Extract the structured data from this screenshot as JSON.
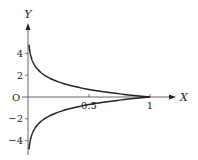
{
  "chart_data": {
    "type": "line",
    "title": "",
    "xlabel": "X",
    "ylabel": "Y",
    "origin_label": "O",
    "x_ticks": [
      0.5,
      1
    ],
    "x_tick_labels": [
      "0.5",
      "1"
    ],
    "y_ticks": [
      4,
      2,
      -2,
      -4
    ],
    "y_tick_labels": [
      "4",
      "2",
      "−2",
      "−4"
    ],
    "xlim": [
      0,
      1.4
    ],
    "ylim": [
      -4.8,
      4.8
    ],
    "grid": false,
    "legend": "none",
    "series": [
      {
        "name": "y = -ln x (upper branch)",
        "x": [
          0.0083,
          0.02,
          0.05,
          0.1,
          0.2,
          0.3,
          0.4,
          0.5,
          0.6,
          0.7,
          0.8,
          0.9,
          1.0
        ],
        "values": [
          4.8,
          3.91,
          3.0,
          2.3,
          1.61,
          1.2,
          0.92,
          0.69,
          0.51,
          0.36,
          0.22,
          0.11,
          0.0
        ]
      },
      {
        "name": "y = ln x (lower branch)",
        "x": [
          0.0083,
          0.02,
          0.05,
          0.1,
          0.2,
          0.3,
          0.4,
          0.5,
          0.6,
          0.7,
          0.8,
          0.9,
          1.0
        ],
        "values": [
          -4.8,
          -3.91,
          -3.0,
          -2.3,
          -1.61,
          -1.2,
          -0.92,
          -0.69,
          -0.51,
          -0.36,
          -0.22,
          -0.11,
          0.0
        ]
      }
    ],
    "colors": {
      "curve": "#222222",
      "axis": "#555555"
    }
  }
}
